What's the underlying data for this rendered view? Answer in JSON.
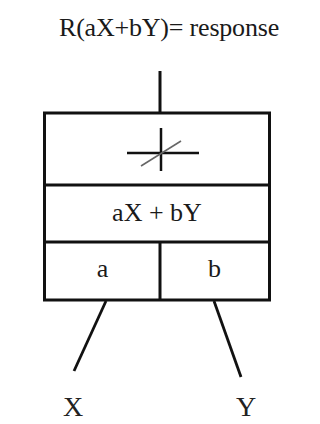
{
  "title": "R(aX+bY)= response",
  "neuron": {
    "activation_symbol": "threshold-cross-icon",
    "summation_label": "aX + bY",
    "weights": [
      {
        "label": "a"
      },
      {
        "label": "b"
      }
    ]
  },
  "inputs": [
    {
      "label": "X"
    },
    {
      "label": "Y"
    }
  ],
  "colors": {
    "stroke": "#111111",
    "diagonal": "#666666",
    "background": "#ffffff"
  }
}
